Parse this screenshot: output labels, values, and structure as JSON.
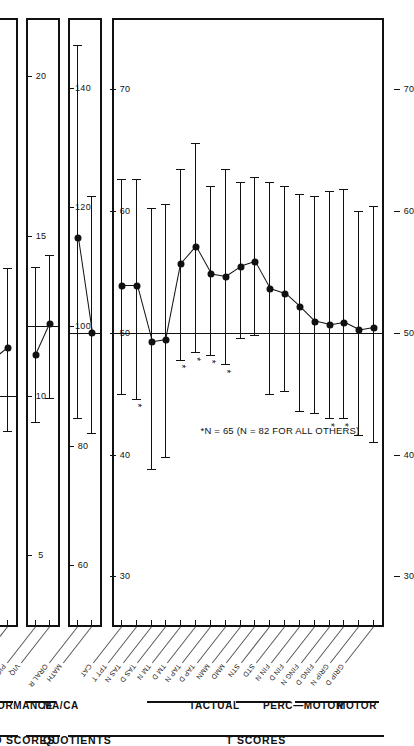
{
  "figure": {
    "footnote": "*N = 65 (N = 82 FOR ALL OTHERS)",
    "sections": [
      {
        "id": "t-scores",
        "label": "T SCORES"
      },
      {
        "id": "quotients",
        "label": "QUOTIENTS"
      },
      {
        "id": "wisc",
        "label": "WISC SCALED SCORES"
      }
    ],
    "groups": [
      {
        "id": "motor",
        "label": "MOTOR"
      },
      {
        "id": "perc-motor",
        "label": "PERC—MOTOR"
      },
      {
        "id": "tactual",
        "label": "TACTUAL"
      },
      {
        "id": "maca",
        "label": "MA/CA"
      },
      {
        "id": "performance",
        "label": "PERFORMANCE"
      },
      {
        "id": "verbal",
        "label": "VERBAL"
      }
    ]
  },
  "chart_data": [
    {
      "id": "panel-t-scores-neuro",
      "type": "scatter",
      "title": "T SCORES",
      "xlabel": "T score",
      "ylabel": "",
      "xlim": [
        75,
        27
      ],
      "ticks": [
        70,
        60,
        50,
        40,
        30
      ],
      "tick_labels": [
        "70",
        "60",
        "50",
        "40",
        "30"
      ],
      "reference_line": 50,
      "grid": false,
      "legend": "none",
      "error_type": "mean ± 1 SD",
      "categories": [
        "GRIP D",
        "GRIP N",
        "FING D",
        "FING N",
        "FIN D",
        "FIN N",
        "STD",
        "STN",
        "MMD",
        "MMN",
        "TAP D",
        "TAP N",
        "TM D",
        "TM N",
        "TAS D",
        "TAS N",
        "TPT T",
        "CAT"
      ],
      "values": [
        50.4,
        50.2,
        50.8,
        50.6,
        50.9,
        52.1,
        53.2,
        53.6,
        55.8,
        55.4,
        54.6,
        54.8,
        57.0,
        55.6,
        49.4,
        49.2,
        53.8,
        53.8
      ],
      "low": [
        41.0,
        41.6,
        43.0,
        43.0,
        43.4,
        43.6,
        45.2,
        45.0,
        49.8,
        49.6,
        47.4,
        48.2,
        48.4,
        47.8,
        39.8,
        38.8,
        44.6,
        45.0
      ],
      "high": [
        60.4,
        60.0,
        61.8,
        61.6,
        61.2,
        61.4,
        62.0,
        62.4,
        62.8,
        62.4,
        63.4,
        62.0,
        65.6,
        63.4,
        60.6,
        60.2,
        62.6,
        62.6
      ],
      "starred": [
        false,
        false,
        true,
        true,
        false,
        false,
        false,
        false,
        false,
        false,
        true,
        true,
        true,
        true,
        false,
        false,
        true,
        false
      ],
      "group_spans": [
        {
          "group": "MOTOR",
          "from": 0,
          "to": 5
        },
        {
          "group": "PERC—MOTOR",
          "from": 6,
          "to": 9
        },
        {
          "group": "TACTUAL",
          "from": 10,
          "to": 15
        }
      ]
    },
    {
      "id": "panel-t-scores-academic",
      "type": "scatter",
      "title": "T SCORES",
      "xlabel": "T score",
      "ylabel": "",
      "xlim": [
        75,
        27
      ],
      "ticks": [
        70,
        60,
        50,
        40,
        30
      ],
      "tick_labels": [
        "70",
        "60",
        "50",
        "40",
        "30"
      ],
      "reference_line": 50,
      "grid": false,
      "legend": "none",
      "error_type": "mean ± 1 SD",
      "categories": [
        "MATH",
        "ORAL R"
      ],
      "values": [
        50.0,
        57.8
      ],
      "low": [
        41.8,
        43.0
      ],
      "high": [
        61.2,
        73.6
      ],
      "starred": [
        false,
        false
      ]
    },
    {
      "id": "panel-quotients",
      "type": "scatter",
      "title": "QUOTIENTS",
      "xlabel": "MA/CA quotient",
      "ylabel": "",
      "xlim": [
        150,
        52
      ],
      "ticks": [
        140,
        120,
        100,
        80,
        60
      ],
      "tick_labels": [
        "140",
        "120",
        "100",
        "80",
        "60"
      ],
      "reference_line": 100,
      "grid": false,
      "legend": "none",
      "error_type": "mean ± 1 SD",
      "categories": [
        "VIQ",
        "PIQ"
      ],
      "values": [
        100.4,
        95.2
      ],
      "low": [
        88.0,
        84.0
      ],
      "high": [
        112.0,
        110.0
      ],
      "starred": [
        false,
        false
      ]
    },
    {
      "id": "panel-wisc",
      "type": "scatter",
      "title": "WISC SCALED SCORES",
      "xlabel": "Scaled score",
      "ylabel": "",
      "xlim": [
        21.5,
        3.2
      ],
      "ticks": [
        20,
        15,
        10,
        5
      ],
      "tick_labels": [
        "20",
        "15",
        "10",
        "5"
      ],
      "reference_line": 10,
      "grid": false,
      "legend": "none",
      "error_type": "mean ± 1 SD",
      "categories": [
        "MAZE",
        "CODE",
        "OBJ AS",
        "BL DES",
        "PIC C",
        "PIC A",
        "VOCAB",
        "SIM",
        "ARITH",
        "DIG SP",
        "COMP",
        "INF"
      ],
      "values": [
        11.5,
        11.1,
        11.4,
        11.0,
        9.4,
        10.0,
        9.6,
        8.6,
        9.5,
        8.8,
        0,
        0
      ],
      "low": [
        8.9,
        8.4,
        8.7,
        8.5,
        7.0,
        7.6,
        7.2,
        6.3,
        7.3,
        6.4,
        0,
        0
      ],
      "high": [
        14.0,
        13.8,
        14.1,
        13.6,
        11.8,
        12.4,
        11.9,
        10.8,
        11.7,
        11.1,
        0,
        0
      ],
      "starred": [
        false,
        false,
        false,
        false,
        false,
        false,
        false,
        false,
        false,
        false,
        false,
        false
      ],
      "group_spans": [
        {
          "group": "PERFORMANCE",
          "from": 0,
          "to": 5
        },
        {
          "group": "VERBAL",
          "from": 6,
          "to": 11
        }
      ]
    }
  ]
}
